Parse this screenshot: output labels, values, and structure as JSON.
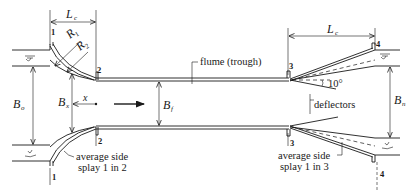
{
  "figure": {
    "type": "plan view of Parshall-type venturi flume",
    "labels": {
      "flume": "flume (trough)",
      "deflectors": "deflectors",
      "inlet_note_line1": "average side",
      "inlet_note_line2": "splay 1 in 2",
      "outlet_note_line1": "average side",
      "outlet_note_line2": "splay 1 in 3",
      "angle": "10°"
    },
    "dimensions": {
      "inlet_length": {
        "main": "L",
        "sub": "c"
      },
      "outlet_length": {
        "main": "L",
        "sub": "c"
      },
      "radius1": {
        "main": "R",
        "sub": "1"
      },
      "radius2": {
        "main": "R",
        "sub": "2"
      },
      "upstream_width": {
        "main": "B",
        "sub": "o"
      },
      "section_width": {
        "main": "B",
        "sub": "x"
      },
      "throat_width": {
        "main": "B",
        "sub": "f"
      },
      "downstream_width": {
        "main": "B",
        "sub": "n"
      },
      "distance": "x"
    },
    "sections": {
      "s1_top": "1",
      "s1_bottom": "1",
      "s2_top": "2",
      "s2_bottom": "2",
      "s3_top": "3",
      "s3_bottom": "3",
      "s4_top": "4",
      "s4_bottom": "4"
    },
    "flow_direction": "left-to-right"
  }
}
